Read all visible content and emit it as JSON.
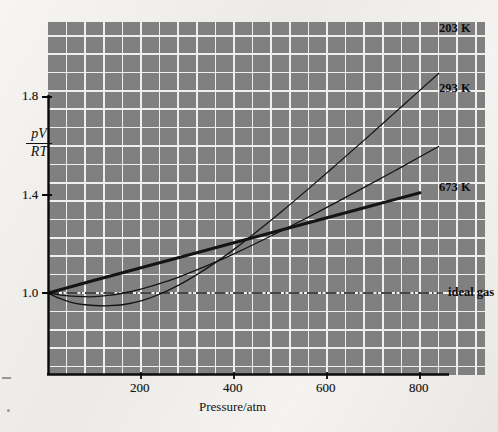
{
  "chart_data": {
    "type": "line",
    "title": "",
    "xlabel": "Pressure/atm",
    "ylabel": "pV/RT",
    "ylabel_numerator": "pV",
    "ylabel_denominator": "RT",
    "xlim": [
      0,
      900
    ],
    "ylim": [
      0.8,
      2.0
    ],
    "xticks": [
      200,
      400,
      600,
      800
    ],
    "xtick_labels": [
      "200",
      "400",
      "600",
      "800"
    ],
    "yticks": [
      1.0,
      1.4,
      1.8
    ],
    "ytick_labels": [
      "1.0",
      "1.4",
      "1.8"
    ],
    "grid": true,
    "grid_x_step": 40,
    "grid_y_step": 0.075,
    "legend_position": "inline-right",
    "background_color": "#808080",
    "grid_color": "#f2f2f2",
    "curve_color": "#141414",
    "series": [
      {
        "name": "203 K",
        "label": "203 K",
        "line_width": 1.3,
        "style": "solid",
        "x": [
          0,
          25,
          50,
          75,
          100,
          130,
          160,
          200,
          240,
          280,
          320,
          360,
          400,
          450,
          500,
          560,
          620,
          680,
          740,
          800,
          840
        ],
        "y": [
          1.0,
          0.978,
          0.962,
          0.953,
          0.949,
          0.948,
          0.952,
          0.968,
          0.995,
          1.031,
          1.075,
          1.124,
          1.178,
          1.252,
          1.329,
          1.425,
          1.524,
          1.624,
          1.726,
          1.828,
          1.896
        ]
      },
      {
        "name": "293 K",
        "label": "293 K",
        "line_width": 1.3,
        "style": "solid",
        "x": [
          0,
          25,
          50,
          75,
          100,
          130,
          160,
          200,
          240,
          280,
          320,
          360,
          400,
          450,
          500,
          560,
          620,
          680,
          740,
          800,
          840
        ],
        "y": [
          1.0,
          0.992,
          0.987,
          0.985,
          0.985,
          0.99,
          0.999,
          1.016,
          1.038,
          1.064,
          1.094,
          1.126,
          1.16,
          1.205,
          1.252,
          1.31,
          1.37,
          1.431,
          1.493,
          1.556,
          1.598
        ]
      },
      {
        "name": "673 K",
        "label": "673 K",
        "line_width": 3.0,
        "style": "solid",
        "x": [
          0,
          100,
          200,
          300,
          400,
          500,
          600,
          700,
          800
        ],
        "y": [
          1.0,
          1.052,
          1.103,
          1.154,
          1.205,
          1.256,
          1.307,
          1.358,
          1.409
        ]
      },
      {
        "name": "ideal gas",
        "label": "ideal gas",
        "line_width": 1.2,
        "style": "dash-dot",
        "x": [
          0,
          900
        ],
        "y": [
          1.0,
          1.0
        ]
      }
    ],
    "annotations": [
      {
        "text": "203 K",
        "x": 860,
        "y": 1.915
      },
      {
        "text": "293 K",
        "x": 860,
        "y": 1.615
      },
      {
        "text": "673 K",
        "x": 800,
        "y": 1.42
      },
      {
        "text": "ideal gas",
        "x": 800,
        "y": 1.0
      }
    ]
  },
  "axes": {
    "x_title": "Pressure/atm",
    "y_title_numerator": "pV",
    "y_title_denominator": "RT",
    "x_tick_labels": [
      "200",
      "400",
      "600",
      "800"
    ],
    "y_tick_labels": [
      "1.8",
      "1.4",
      "1.0"
    ]
  },
  "labels": {
    "series_203": "203 K",
    "series_293": "293 K",
    "series_673": "673 K",
    "ideal_gas": "ideal gas"
  },
  "colors": {
    "plot_background": "#808080",
    "gridline": "#f2f2f2",
    "curve": "#141414",
    "page_background": "#f2f1ef"
  }
}
